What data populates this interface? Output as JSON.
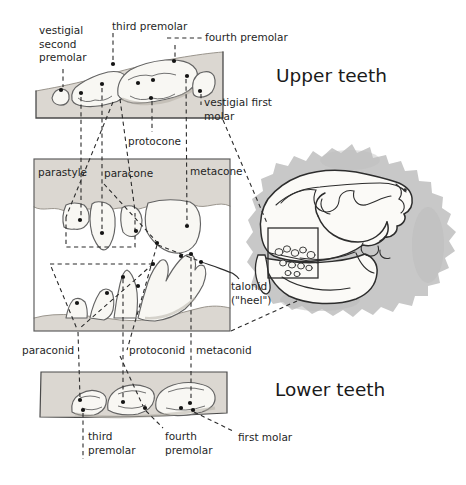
{
  "figure_title": "Carnivore upper and lower teeth diagram",
  "headings": {
    "upper": "Upper teeth",
    "lower": "Lower teeth"
  },
  "labels": {
    "vestigial_second_premolar": [
      "vestigial",
      "second",
      "premolar"
    ],
    "third_premolar_top": "third premolar",
    "fourth_premolar_top": "fourth premolar",
    "vestigial_first_molar": [
      "vestigial first",
      "molar"
    ],
    "protocone": "protocone",
    "parastyle": "parastyle",
    "paracone": "paracone",
    "metacone": "metacone",
    "talonid": [
      "talonid",
      "(\"heel\")"
    ],
    "paraconid": "paraconid",
    "protoconid": "protoconid",
    "metaconid": "metaconid",
    "third_premolar_bottom": [
      "third",
      "premolar"
    ],
    "fourth_premolar_bottom": [
      "fourth",
      "premolar"
    ],
    "first_molar": "first molar"
  },
  "icons": {
    "cusp_dot": "filled black dot marking a tooth cusp",
    "skull_inset_box": "rectangle marking tooth row on skull"
  },
  "colors": {
    "background": "#ffffff",
    "band": "#dbd7d1",
    "band_edge": "#4a4a4a",
    "gum_line": "#9a958d",
    "tooth": "#f8f7f3",
    "tooth_outline": "#636363",
    "tooth_shadow": "#b2ada4",
    "dash": "#2b2b2b",
    "dot": "#141414",
    "panel_border": "#5f5f5f",
    "shadow_blob": "#c8c8c8",
    "shadow_inner": "#bcbcbc",
    "bone": "#fbfaf7",
    "skull_outline": "#2d2d2d",
    "text": "#1f1f1f"
  }
}
